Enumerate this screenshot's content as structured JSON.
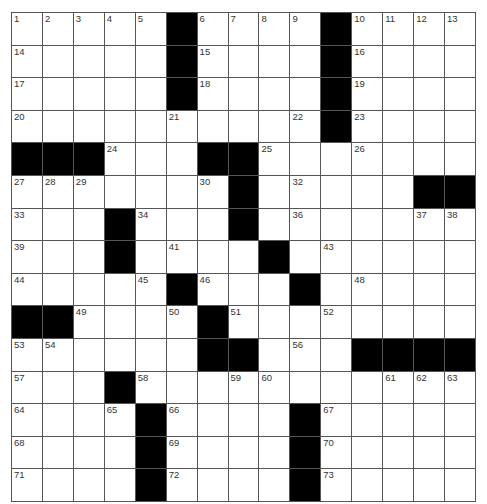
{
  "puzzle": {
    "rows": 15,
    "cols": 15,
    "grid": [
      ".....#....#....",
      ".....#....#....",
      ".....#....#....",
      "..........#....",
      "###...##.......",
      ".......#.....##",
      "...#...#.......",
      "...#....#......",
      ".....#...#.....",
      "##....#........",
      "......##...####",
      "...#...........",
      "....#....#.....",
      "....#....#.....",
      "....#....#....."
    ],
    "numbers": [
      [
        1,
        2,
        3,
        4,
        5,
        0,
        6,
        7,
        8,
        9,
        0,
        10,
        11,
        12,
        13
      ],
      [
        14,
        0,
        0,
        0,
        0,
        0,
        15,
        0,
        0,
        0,
        0,
        16,
        0,
        0,
        0
      ],
      [
        17,
        0,
        0,
        0,
        0,
        0,
        18,
        0,
        0,
        0,
        0,
        19,
        0,
        0,
        0
      ],
      [
        20,
        0,
        0,
        0,
        0,
        21,
        0,
        0,
        0,
        22,
        0,
        23,
        0,
        0,
        0
      ],
      [
        0,
        0,
        0,
        24,
        0,
        0,
        0,
        0,
        25,
        0,
        0,
        26,
        0,
        0,
        0
      ],
      [
        27,
        28,
        29,
        0,
        0,
        0,
        30,
        31,
        0,
        32,
        0,
        0,
        0,
        0,
        0
      ],
      [
        33,
        0,
        0,
        0,
        34,
        0,
        0,
        35,
        0,
        36,
        0,
        0,
        0,
        37,
        38
      ],
      [
        39,
        0,
        0,
        40,
        0,
        41,
        0,
        0,
        42,
        0,
        43,
        0,
        0,
        0,
        0
      ],
      [
        44,
        0,
        0,
        0,
        45,
        0,
        46,
        0,
        0,
        47,
        0,
        48,
        0,
        0,
        0
      ],
      [
        0,
        0,
        49,
        0,
        0,
        50,
        0,
        51,
        0,
        0,
        52,
        0,
        0,
        0,
        0
      ],
      [
        53,
        54,
        0,
        0,
        0,
        0,
        55,
        0,
        0,
        56,
        0,
        0,
        0,
        0,
        0
      ],
      [
        57,
        0,
        0,
        0,
        58,
        0,
        0,
        59,
        60,
        0,
        0,
        0,
        61,
        62,
        63
      ],
      [
        64,
        0,
        0,
        65,
        0,
        66,
        0,
        0,
        0,
        0,
        67,
        0,
        0,
        0,
        0
      ],
      [
        68,
        0,
        0,
        0,
        0,
        69,
        0,
        0,
        0,
        0,
        70,
        0,
        0,
        0,
        0
      ],
      [
        71,
        0,
        0,
        0,
        0,
        72,
        0,
        0,
        0,
        0,
        73,
        0,
        0,
        0,
        0
      ]
    ]
  },
  "colors": {
    "block": "#000000",
    "cell": "#ffffff",
    "line": "#555555"
  }
}
